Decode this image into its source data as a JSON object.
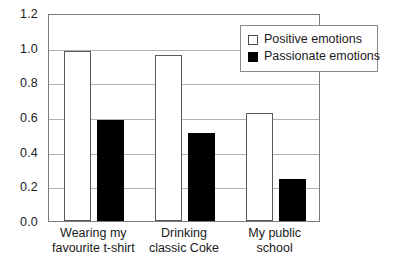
{
  "chart_data": {
    "type": "bar",
    "title": "",
    "subtitle": "",
    "xlabel": "",
    "ylabel": "",
    "ylim": [
      0.0,
      1.2
    ],
    "ytick_labels": [
      "0.0",
      "0.2",
      "0.4",
      "0.6",
      "0.8",
      "1.0",
      "1.2"
    ],
    "ytick_values": [
      0.0,
      0.2,
      0.4,
      0.6,
      0.8,
      1.0,
      1.2
    ],
    "grid": true,
    "legend_position": "top-right",
    "categories": [
      "Wearing my favourite t-shirt",
      "Drinking classic Coke",
      "My public school"
    ],
    "category_lines": [
      [
        "Wearing my",
        "favourite t-shirt"
      ],
      [
        "Drinking",
        "classic Coke"
      ],
      [
        "My public",
        "school"
      ]
    ],
    "series": [
      {
        "name": "Positive emotions",
        "color": "#ffffff",
        "edge_color": "#595959",
        "values": [
          0.98,
          0.96,
          0.625
        ]
      },
      {
        "name": "Passionate emotions",
        "color": "#000000",
        "edge_color": "#000000",
        "values": [
          0.585,
          0.505,
          0.245
        ]
      }
    ]
  },
  "legend": {
    "items": [
      {
        "label": "Positive emotions",
        "swatch": "open-square-swatch"
      },
      {
        "label": "Passionate emotions",
        "swatch": "filled-square-swatch"
      }
    ]
  },
  "axes": {
    "y_ticks": [
      "0.0",
      "0.2",
      "0.4",
      "0.6",
      "0.8",
      "1.0",
      "1.2"
    ],
    "x_labels": [
      {
        "line1": "Wearing my",
        "line2": "favourite t-shirt"
      },
      {
        "line1": "Drinking",
        "line2": "classic Coke"
      },
      {
        "line1": "My public",
        "line2": "school"
      }
    ]
  },
  "colors": {
    "frame": "#7a7a7a",
    "gridline": "#b2b2b2",
    "positive_fill": "#ffffff",
    "passionate_fill": "#000000",
    "text": "#1a1a1a",
    "background": "#ffffff"
  }
}
